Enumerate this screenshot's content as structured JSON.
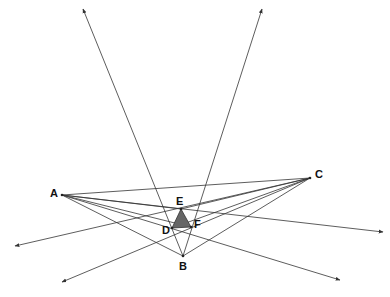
{
  "diagram": {
    "points": {
      "A": {
        "label": "A",
        "x": 62,
        "y": 195
      },
      "B": {
        "label": "B",
        "x": 183,
        "y": 256
      },
      "C": {
        "label": "C",
        "x": 310,
        "y": 178
      },
      "D": {
        "label": "D",
        "x": 172,
        "y": 228
      },
      "E": {
        "label": "E",
        "x": 181,
        "y": 209
      },
      "F": {
        "label": "F",
        "x": 191,
        "y": 227
      }
    },
    "triangle_sides": [
      [
        "A",
        "B"
      ],
      [
        "B",
        "C"
      ],
      [
        "A",
        "C"
      ]
    ],
    "rays": [
      {
        "from": "B",
        "to": [
          83,
          9
        ]
      },
      {
        "from": "B",
        "to": [
          262,
          9
        ]
      },
      {
        "from": "A",
        "to": [
          383,
          232
        ]
      },
      {
        "from": "A",
        "to": [
          340,
          280
        ]
      },
      {
        "from": "C",
        "to": [
          15,
          246
        ]
      },
      {
        "from": "C",
        "to": [
          62,
          282
        ]
      }
    ],
    "segments": [
      {
        "from": "A",
        "to": "E"
      },
      {
        "from": "A",
        "to": "F"
      },
      {
        "from": "C",
        "to": "D"
      },
      {
        "from": "C",
        "to": "E"
      }
    ],
    "morley_triangle": [
      "D",
      "E",
      "F"
    ],
    "colors": {
      "line": "#333333",
      "fill": "#666666",
      "label": "#111111"
    }
  }
}
